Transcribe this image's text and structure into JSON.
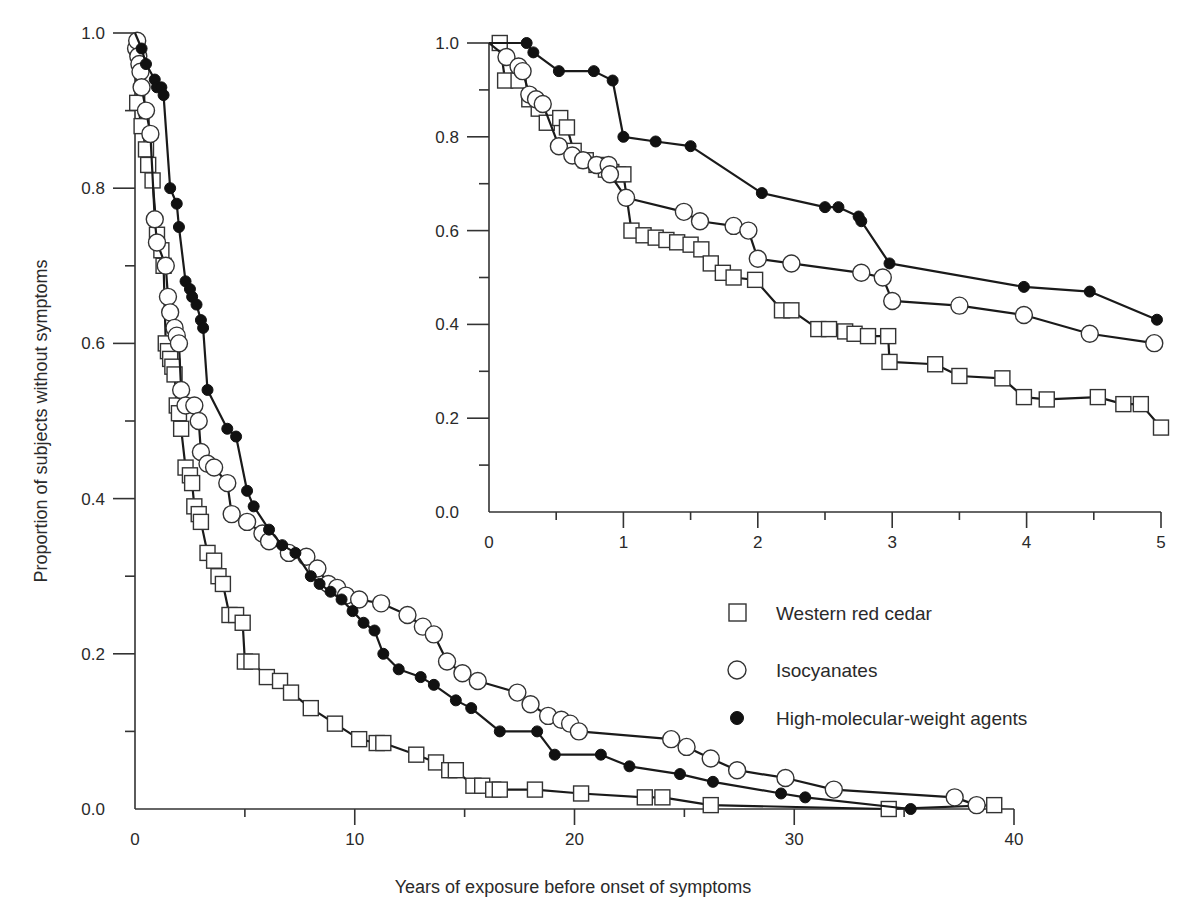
{
  "figure": {
    "ylabel": "Proportion of subjects without symptoms",
    "xlabel": "Years of exposure before onset of symptoms"
  },
  "legend": {
    "items": [
      {
        "label": "Western red cedar",
        "marker": "open-square"
      },
      {
        "label": "Isocyanates",
        "marker": "open-circle"
      },
      {
        "label": "High-molecular-weight agents",
        "marker": "filled-circle"
      }
    ]
  },
  "colors": {
    "line": "#1a1a1a",
    "marker_fill_open": "#ffffff",
    "marker_fill_filled": "#111111",
    "axis": "#333333",
    "background": "#ffffff"
  },
  "chart_data": [
    {
      "id": "main",
      "type": "line",
      "title": "",
      "xlabel": "Years of exposure before onset of symptoms",
      "ylabel": "Proportion of subjects without symptoms",
      "xlim": [
        0,
        40
      ],
      "ylim": [
        0,
        1.0
      ],
      "xticks": [
        0,
        10,
        20,
        30,
        40
      ],
      "xtick_labels": [
        "0",
        "10",
        "20",
        "30",
        "40"
      ],
      "yticks": [
        0.0,
        0.2,
        0.4,
        0.6,
        0.8,
        1.0
      ],
      "ytick_labels": [
        "0.0",
        "0.2",
        "0.4",
        "0.6",
        "0.8",
        "1.0"
      ],
      "grid": false,
      "legend_position": "center-right",
      "series": [
        {
          "name": "Western red cedar",
          "marker": "open-square",
          "x": [
            0.1,
            0.3,
            0.5,
            0.6,
            0.8,
            1.0,
            1.2,
            1.3,
            1.4,
            1.5,
            1.6,
            1.7,
            1.8,
            1.9,
            2.0,
            2.1,
            2.3,
            2.5,
            2.6,
            2.7,
            2.9,
            3.0,
            3.3,
            3.6,
            3.8,
            4.0,
            4.3,
            4.6,
            4.9,
            5.0,
            5.3,
            6.0,
            6.6,
            7.1,
            8.0,
            9.1,
            10.2,
            11.0,
            11.3,
            12.8,
            13.7,
            14.3,
            14.6,
            15.4,
            15.8,
            16.3,
            16.6,
            18.2,
            20.3,
            23.2,
            24.0,
            26.2,
            34.3,
            39.1
          ],
          "y": [
            0.91,
            0.88,
            0.85,
            0.83,
            0.81,
            0.74,
            0.72,
            0.7,
            0.6,
            0.59,
            0.58,
            0.57,
            0.56,
            0.52,
            0.51,
            0.49,
            0.44,
            0.43,
            0.42,
            0.39,
            0.38,
            0.37,
            0.33,
            0.32,
            0.3,
            0.29,
            0.25,
            0.25,
            0.24,
            0.19,
            0.19,
            0.17,
            0.165,
            0.15,
            0.13,
            0.11,
            0.09,
            0.085,
            0.085,
            0.07,
            0.06,
            0.05,
            0.05,
            0.03,
            0.03,
            0.025,
            0.025,
            0.025,
            0.02,
            0.015,
            0.015,
            0.005,
            0.0,
            0.005
          ]
        },
        {
          "name": "Isocyanates",
          "marker": "open-circle",
          "x": [
            0.05,
            0.1,
            0.15,
            0.2,
            0.25,
            0.3,
            0.5,
            0.7,
            0.9,
            1.0,
            1.4,
            1.5,
            1.6,
            1.8,
            1.9,
            2.0,
            2.1,
            2.3,
            2.7,
            2.9,
            3.0,
            3.3,
            3.6,
            4.2,
            4.4,
            5.1,
            5.8,
            6.1,
            7.0,
            7.8,
            8.3,
            8.8,
            9.2,
            9.6,
            10.2,
            11.2,
            12.4,
            13.1,
            13.6,
            14.2,
            14.9,
            15.6,
            17.4,
            18.0,
            18.8,
            19.4,
            19.8,
            20.2,
            24.4,
            25.1,
            26.2,
            27.4,
            29.6,
            31.8,
            37.3,
            38.3
          ],
          "y": [
            0.98,
            0.99,
            0.97,
            0.96,
            0.95,
            0.93,
            0.9,
            0.87,
            0.76,
            0.73,
            0.7,
            0.66,
            0.64,
            0.62,
            0.61,
            0.6,
            0.54,
            0.52,
            0.52,
            0.5,
            0.46,
            0.445,
            0.44,
            0.42,
            0.38,
            0.37,
            0.355,
            0.345,
            0.33,
            0.325,
            0.31,
            0.29,
            0.285,
            0.275,
            0.27,
            0.265,
            0.25,
            0.235,
            0.225,
            0.19,
            0.175,
            0.165,
            0.15,
            0.135,
            0.12,
            0.115,
            0.11,
            0.1,
            0.09,
            0.08,
            0.065,
            0.05,
            0.04,
            0.025,
            0.015,
            0.005
          ]
        },
        {
          "name": "High-molecular-weight agents",
          "marker": "filled-circle",
          "x": [
            0.3,
            0.5,
            0.9,
            1.0,
            1.2,
            1.3,
            1.6,
            1.9,
            2.0,
            2.3,
            2.5,
            2.6,
            2.8,
            3.0,
            3.1,
            3.3,
            4.2,
            4.6,
            5.1,
            5.4,
            6.1,
            6.7,
            7.3,
            8.0,
            8.4,
            8.9,
            9.4,
            9.9,
            10.4,
            10.9,
            11.3,
            12.0,
            13.0,
            13.6,
            14.6,
            15.3,
            16.6,
            18.3,
            19.1,
            21.2,
            22.5,
            24.8,
            26.3,
            29.4,
            30.5,
            35.3
          ],
          "y": [
            0.98,
            0.96,
            0.94,
            0.93,
            0.93,
            0.92,
            0.8,
            0.78,
            0.75,
            0.68,
            0.67,
            0.66,
            0.65,
            0.63,
            0.62,
            0.54,
            0.49,
            0.48,
            0.41,
            0.39,
            0.36,
            0.34,
            0.33,
            0.3,
            0.29,
            0.28,
            0.27,
            0.255,
            0.24,
            0.23,
            0.2,
            0.18,
            0.17,
            0.16,
            0.14,
            0.13,
            0.1,
            0.1,
            0.07,
            0.07,
            0.055,
            0.045,
            0.035,
            0.02,
            0.015,
            0.0
          ]
        }
      ]
    },
    {
      "id": "inset",
      "type": "line",
      "title": "",
      "xlabel": "",
      "ylabel": "",
      "xlim": [
        0,
        5
      ],
      "ylim": [
        0,
        1.0
      ],
      "xticks": [
        0,
        1,
        2,
        3,
        4,
        5
      ],
      "xtick_labels": [
        "0",
        "1",
        "2",
        "3",
        "4",
        "5"
      ],
      "yticks": [
        0.0,
        0.2,
        0.4,
        0.6,
        0.8,
        1.0
      ],
      "ytick_labels": [
        "0.0",
        "0.2",
        "0.4",
        "0.6",
        "0.8",
        "1.0"
      ],
      "grid": false,
      "series": [
        {
          "name": "Western red cedar",
          "marker": "open-square",
          "x": [
            0.08,
            0.12,
            0.22,
            0.3,
            0.37,
            0.43,
            0.53,
            0.58,
            0.63,
            0.72,
            0.8,
            0.87,
            0.91,
            0.96,
            1.0,
            1.06,
            1.15,
            1.24,
            1.32,
            1.4,
            1.5,
            1.58,
            1.65,
            1.74,
            1.82,
            1.98,
            2.18,
            2.25,
            2.45,
            2.53,
            2.65,
            2.72,
            2.82,
            2.97,
            2.98,
            3.32,
            3.5,
            3.82,
            3.98,
            4.15,
            4.53,
            4.72,
            4.85,
            5.0
          ],
          "y": [
            1.0,
            0.92,
            0.92,
            0.88,
            0.86,
            0.83,
            0.84,
            0.82,
            0.77,
            0.75,
            0.74,
            0.73,
            0.725,
            0.72,
            0.72,
            0.6,
            0.59,
            0.585,
            0.58,
            0.575,
            0.57,
            0.56,
            0.53,
            0.51,
            0.5,
            0.495,
            0.43,
            0.43,
            0.39,
            0.39,
            0.385,
            0.38,
            0.375,
            0.375,
            0.32,
            0.315,
            0.29,
            0.285,
            0.245,
            0.24,
            0.245,
            0.23,
            0.23,
            0.18
          ]
        },
        {
          "name": "Isocyanates",
          "marker": "open-circle",
          "x": [
            0.13,
            0.22,
            0.25,
            0.3,
            0.35,
            0.4,
            0.52,
            0.62,
            0.7,
            0.8,
            0.89,
            0.9,
            1.02,
            1.45,
            1.57,
            1.82,
            1.93,
            2.0,
            2.25,
            2.77,
            2.93,
            3.0,
            3.5,
            3.98,
            4.47,
            4.95
          ],
          "y": [
            0.97,
            0.95,
            0.94,
            0.89,
            0.88,
            0.87,
            0.78,
            0.76,
            0.75,
            0.74,
            0.74,
            0.72,
            0.67,
            0.64,
            0.62,
            0.61,
            0.6,
            0.54,
            0.53,
            0.51,
            0.5,
            0.45,
            0.44,
            0.42,
            0.38,
            0.36
          ]
        },
        {
          "name": "High-molecular-weight agents",
          "marker": "filled-circle",
          "x": [
            0.28,
            0.33,
            0.52,
            0.78,
            0.92,
            1.0,
            1.24,
            1.5,
            2.03,
            2.5,
            2.6,
            2.75,
            2.77,
            2.98,
            3.98,
            4.47,
            4.97
          ],
          "y": [
            1.0,
            0.98,
            0.94,
            0.94,
            0.92,
            0.8,
            0.79,
            0.78,
            0.68,
            0.65,
            0.65,
            0.63,
            0.62,
            0.53,
            0.48,
            0.47,
            0.41
          ]
        }
      ]
    }
  ]
}
